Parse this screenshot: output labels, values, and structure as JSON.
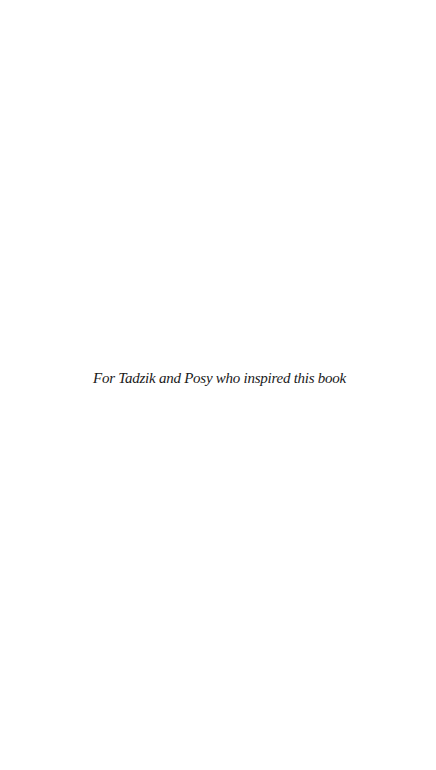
{
  "page": {
    "background_color": "#ffffff",
    "text_color": "#1a1a1a"
  },
  "dedication": {
    "text": "For Tadzik and Posy who inspired this book"
  }
}
